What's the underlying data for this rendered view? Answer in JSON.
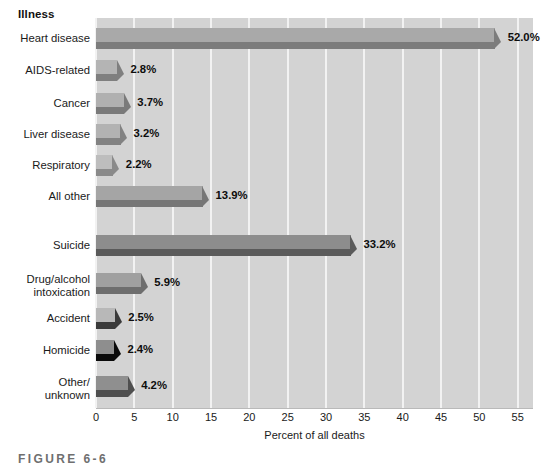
{
  "chart_data": {
    "type": "bar",
    "orientation": "horizontal",
    "title": "",
    "xlabel": "Percent of all deaths",
    "ylabel": "",
    "xlim": [
      0,
      57
    ],
    "grid": true,
    "legend": "none",
    "xticks": [
      "0",
      "5",
      "10",
      "15",
      "20",
      "25",
      "30",
      "35",
      "40",
      "45",
      "50",
      "55"
    ],
    "xtick_values": [
      0,
      5,
      10,
      15,
      20,
      25,
      30,
      35,
      40,
      45,
      50,
      55
    ],
    "group_header": "Illness",
    "categories": [
      "Heart disease",
      "AIDS-related",
      "Cancer",
      "Liver disease",
      "Respiratory",
      "All other",
      "Suicide",
      "Drug/alcohol intoxication",
      "Accident",
      "Homicide",
      "Other/unknown"
    ],
    "values": [
      52.0,
      2.8,
      3.7,
      3.2,
      2.2,
      13.9,
      33.2,
      5.9,
      2.5,
      2.4,
      4.2
    ],
    "data_labels": [
      "52.0%",
      "2.8%",
      "3.7%",
      "3.2%",
      "2.2%",
      "13.9%",
      "33.2%",
      "5.9%",
      "2.5%",
      "2.4%",
      "4.2%"
    ]
  },
  "bars": [
    {
      "label": "Heart disease",
      "label_lines": "Heart disease",
      "value": 52.0,
      "data_label": "52.0%",
      "top_color": "#a9a9a9",
      "shadow_color": "#7c7c7c"
    },
    {
      "label": "AIDS-related",
      "label_lines": "AIDS-related",
      "value": 2.8,
      "data_label": "2.8%",
      "top_color": "#b4b4b4",
      "shadow_color": "#7f7f7f"
    },
    {
      "label": "Cancer",
      "label_lines": "Cancer",
      "value": 3.7,
      "data_label": "3.7%",
      "top_color": "#b0b0b0",
      "shadow_color": "#7a7a7a"
    },
    {
      "label": "Liver disease",
      "label_lines": "Liver disease",
      "value": 3.2,
      "data_label": "3.2%",
      "top_color": "#b2b2b2",
      "shadow_color": "#828282"
    },
    {
      "label": "Respiratory",
      "label_lines": "Respiratory",
      "value": 2.2,
      "data_label": "2.2%",
      "top_color": "#bdbdbd",
      "shadow_color": "#8a8a8a"
    },
    {
      "label": "All other",
      "label_lines": "All other",
      "value": 13.9,
      "data_label": "13.9%",
      "top_color": "#a5a5a5",
      "shadow_color": "#767676"
    },
    {
      "label": "Suicide",
      "label_lines": "Suicide",
      "value": 33.2,
      "data_label": "33.2%",
      "top_color": "#8d8d8d",
      "shadow_color": "#5a5a5a"
    },
    {
      "label": "Drug/alcohol intoxication",
      "label_lines": "Drug/alcohol\nintoxication",
      "value": 5.9,
      "data_label": "5.9%",
      "top_color": "#a0a0a0",
      "shadow_color": "#6e6e6e"
    },
    {
      "label": "Accident",
      "label_lines": "Accident",
      "value": 2.5,
      "data_label": "2.5%",
      "top_color": "#b8b8b8",
      "shadow_color": "#3a3a3a"
    },
    {
      "label": "Homicide",
      "label_lines": "Homicide",
      "value": 2.4,
      "data_label": "2.4%",
      "top_color": "#8e8e8e",
      "shadow_color": "#0a0a0a"
    },
    {
      "label": "Other/unknown",
      "label_lines": "Other/\nunknown",
      "value": 4.2,
      "data_label": "4.2%",
      "top_color": "#8f8f8f",
      "shadow_color": "#4f4f4f"
    }
  ],
  "axis": {
    "title": "Percent of all deaths",
    "ticks": [
      "0",
      "5",
      "10",
      "15",
      "20",
      "25",
      "30",
      "35",
      "40",
      "45",
      "50",
      "55"
    ]
  },
  "header": {
    "group_label": "Illness"
  },
  "caption": {
    "text": "FIGURE 6-6"
  },
  "colors": {
    "plot_background": "#d3d3d3",
    "gridline": "#f2f2f2",
    "page_background": "#ffffff",
    "text": "#1a1a1a"
  }
}
